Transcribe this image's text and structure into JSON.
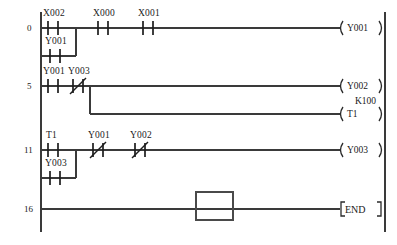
{
  "diagram": {
    "type": "ladder-logic",
    "caption": "",
    "colors": {
      "background": "#ffffff",
      "rail": "#3a3a3a",
      "wire": "#3a3a3a",
      "symbol": "#1d1d1d",
      "text": "#1a1a1a",
      "cursor": "#4a4a4a"
    },
    "rungs": [
      {
        "step": "0",
        "branches": [
          {
            "contacts": [
              {
                "label": "X002",
                "kind": "normally-open"
              },
              {
                "label": "X000",
                "kind": "normally-open"
              },
              {
                "label": "X001",
                "kind": "normally-open"
              }
            ]
          },
          {
            "contacts": [
              {
                "label": "Y001",
                "kind": "normally-open"
              }
            ]
          }
        ],
        "outputs": [
          {
            "label": "Y001",
            "kind": "coil",
            "preset": ""
          }
        ]
      },
      {
        "step": "5",
        "branches": [
          {
            "contacts": [
              {
                "label": "Y001",
                "kind": "normally-open"
              },
              {
                "label": "Y003",
                "kind": "normally-closed"
              }
            ]
          }
        ],
        "outputs": [
          {
            "label": "Y002",
            "kind": "coil",
            "preset": ""
          },
          {
            "label": "T1",
            "kind": "timer-coil",
            "preset": "K100"
          }
        ]
      },
      {
        "step": "11",
        "branches": [
          {
            "contacts": [
              {
                "label": "T1",
                "kind": "normally-open"
              },
              {
                "label": "Y001",
                "kind": "normally-closed"
              },
              {
                "label": "Y002",
                "kind": "normally-closed"
              }
            ]
          },
          {
            "contacts": [
              {
                "label": "Y003",
                "kind": "normally-open"
              }
            ]
          }
        ],
        "outputs": [
          {
            "label": "Y003",
            "kind": "coil",
            "preset": ""
          }
        ]
      },
      {
        "step": "16",
        "branches": [
          {
            "contacts": []
          }
        ],
        "outputs": [
          {
            "label": "END",
            "kind": "instruction",
            "preset": ""
          }
        ]
      }
    ],
    "cursor": {
      "visible": true,
      "on_step": "16"
    },
    "labels": {
      "step_0": "0",
      "step_5": "5",
      "step_11": "11",
      "step_16": "16",
      "r0_c1": "X002",
      "r0_c2": "X000",
      "r0_c3": "X001",
      "r0_b1": "Y001",
      "r0_out": "Y001",
      "r5_c1": "Y001",
      "r5_c2": "Y003",
      "r5_out1": "Y002",
      "r5_out2": "T1",
      "r5_preset": "K100",
      "r11_c1": "T1",
      "r11_c2": "Y001",
      "r11_c3": "Y002",
      "r11_b1": "Y003",
      "r11_out": "Y003",
      "r16_out": "END"
    }
  }
}
